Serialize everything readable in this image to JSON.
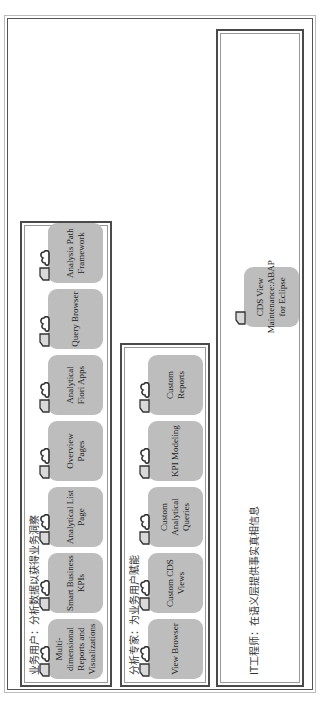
{
  "diagram": {
    "groups": [
      {
        "id": "business",
        "title": "业务用户：分析数据以获得业务洞察",
        "tiles": [
          {
            "label": "Multi-dimensional Reports and Visualizations"
          },
          {
            "label": "Smart Business KPIs"
          },
          {
            "label": "Analytical List Page"
          },
          {
            "label": "Overview Pages"
          },
          {
            "label": "Analytical Fiori Apps"
          },
          {
            "label": "Query Browser"
          },
          {
            "label": "Analysis Path Framework"
          }
        ]
      },
      {
        "id": "analytics",
        "title": "分析专家：为业务用户赋能",
        "tiles": [
          {
            "label": "View Browser"
          },
          {
            "label": "Custom CDS Views"
          },
          {
            "label": "Custom Analytical Queries"
          },
          {
            "label": "KPI Modeling"
          },
          {
            "label": "Custom Reports"
          }
        ]
      },
      {
        "id": "it",
        "title": "IT工程师：在语义层提供事实真相信息",
        "tiles": [
          {
            "label": "CDS View Maintenance:ABAP for Eclipse"
          }
        ]
      }
    ],
    "icons": {
      "tag": "tag-icon",
      "cloud": "cloud-icon"
    },
    "colors": {
      "tile_fill": "#bdbdbd",
      "border": "#4a4a4a",
      "tag_fill": "#d9d9d9"
    }
  }
}
